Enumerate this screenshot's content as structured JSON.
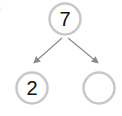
{
  "label": ")",
  "diagram": {
    "type": "number-bond",
    "whole": {
      "value": "7"
    },
    "parts": [
      {
        "value": "2"
      },
      {
        "value": ""
      }
    ],
    "colors": {
      "circle_stroke": "#c8c8c8",
      "arrow": "#8a8a8a",
      "text": "#111111"
    }
  }
}
